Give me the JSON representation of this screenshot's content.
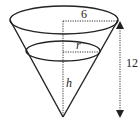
{
  "diagram": {
    "type": "cone-water-level",
    "labels": {
      "top_radius": "6",
      "water_radius": "r",
      "water_height": "h",
      "cone_height": "12"
    },
    "colors": {
      "stroke": "#222222",
      "background": "#ffffff"
    }
  }
}
